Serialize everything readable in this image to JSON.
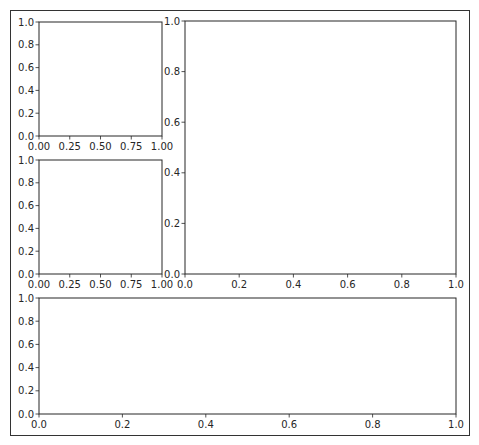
{
  "chart_data": [
    {
      "id": "ax-top-left",
      "type": "line",
      "title": "",
      "xlabel": "",
      "ylabel": "",
      "xlim": [
        0,
        1
      ],
      "ylim": [
        0,
        1
      ],
      "xticks": [
        "0.00",
        "0.25",
        "0.50",
        "0.75",
        "1.00"
      ],
      "xtick_values": [
        0,
        0.25,
        0.5,
        0.75,
        1.0
      ],
      "yticks": [
        "0.0",
        "0.2",
        "0.4",
        "0.6",
        "0.8",
        "1.0"
      ],
      "ytick_values": [
        0,
        0.2,
        0.4,
        0.6,
        0.8,
        1.0
      ],
      "series": [],
      "grid": false
    },
    {
      "id": "ax-mid-left",
      "type": "line",
      "title": "",
      "xlabel": "",
      "ylabel": "",
      "xlim": [
        0,
        1
      ],
      "ylim": [
        0,
        1
      ],
      "xticks": [
        "0.00",
        "0.25",
        "0.50",
        "0.75",
        "1.00"
      ],
      "xtick_values": [
        0,
        0.25,
        0.5,
        0.75,
        1.0
      ],
      "yticks": [
        "0.0",
        "0.2",
        "0.4",
        "0.6",
        "0.8",
        "1.0"
      ],
      "ytick_values": [
        0,
        0.2,
        0.4,
        0.6,
        0.8,
        1.0
      ],
      "series": [],
      "grid": false
    },
    {
      "id": "ax-right-large",
      "type": "line",
      "title": "",
      "xlabel": "",
      "ylabel": "",
      "xlim": [
        0,
        1
      ],
      "ylim": [
        0,
        1
      ],
      "xticks": [
        "0.0",
        "0.2",
        "0.4",
        "0.6",
        "0.8",
        "1.0"
      ],
      "xtick_values": [
        0,
        0.2,
        0.4,
        0.6,
        0.8,
        1.0
      ],
      "yticks": [
        "0.0",
        "0.2",
        "0.4",
        "0.6",
        "0.8",
        "1.0"
      ],
      "ytick_values": [
        0,
        0.2,
        0.4,
        0.6,
        0.8,
        1.0
      ],
      "series": [],
      "grid": false
    },
    {
      "id": "ax-bottom-wide",
      "type": "line",
      "title": "",
      "xlabel": "",
      "ylabel": "",
      "xlim": [
        0,
        1
      ],
      "ylim": [
        0,
        1
      ],
      "xticks": [
        "0.0",
        "0.2",
        "0.4",
        "0.6",
        "0.8",
        "1.0"
      ],
      "xtick_values": [
        0,
        0.2,
        0.4,
        0.6,
        0.8,
        1.0
      ],
      "yticks": [
        "0.0",
        "0.2",
        "0.4",
        "0.6",
        "0.8",
        "1.0"
      ],
      "ytick_values": [
        0,
        0.2,
        0.4,
        0.6,
        0.8,
        1.0
      ],
      "series": [],
      "grid": false
    }
  ],
  "colors": {
    "spine": "#262626",
    "text": "#262626",
    "frame": "#333333",
    "background": "#ffffff"
  }
}
